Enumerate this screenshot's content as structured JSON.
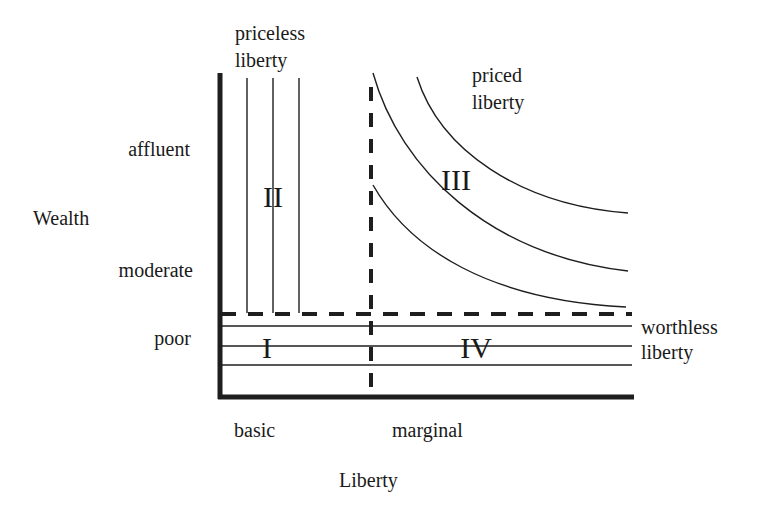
{
  "diagram": {
    "axes": {
      "y_title": "Wealth",
      "x_title": "Liberty",
      "y_ticks": [
        "affluent",
        "moderate",
        "poor"
      ],
      "x_ticks": [
        "basic",
        "marginal"
      ]
    },
    "regions": {
      "I": "I",
      "II": "II",
      "III": "III",
      "IV": "IV"
    },
    "annotations": {
      "priceless_line1": "priceless",
      "priceless_line2": "liberty",
      "priced_line1": "priced",
      "priced_line2": "liberty",
      "worthless_line1": "worthless",
      "worthless_line2": "liberty"
    },
    "colors": {
      "ink": "#1e1e1e",
      "background": "#ffffff"
    }
  }
}
